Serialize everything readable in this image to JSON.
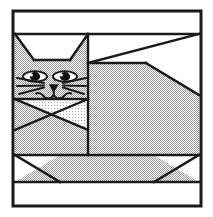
{
  "figure": {
    "title": "Cat quilt block",
    "caption": "Patchwork cat pieced block diagram",
    "width": 213,
    "height": 217
  },
  "colors": {
    "background": "#ffffff",
    "line": "#1a1a1a",
    "fabric_print": "#c9c9c9",
    "fabric_light": "#e4e4e4",
    "fabric_white": "#ffffff",
    "eye_black": "#111111",
    "eye_highlight": "#ffffff"
  },
  "frame": {
    "label": "Block outer border",
    "x": 13,
    "y": 11,
    "width": 188,
    "height": 195,
    "stroke_width": 3
  },
  "grid_lines": {
    "label": "Seam lines",
    "top_sash_y": 34,
    "lower_sash_y": 155,
    "bottom_sash_y": 182,
    "head_body_divider_x": 88,
    "head_ear_base_y": 60,
    "face_chin_y": 99,
    "head_bottom_y": 130
  },
  "parts": [
    {
      "name": "top-sashing-strip",
      "label": "Top sashing strip",
      "fill": "fabric_white"
    },
    {
      "name": "left-ear",
      "label": "Left ear",
      "fill": "fabric_print"
    },
    {
      "name": "right-ear",
      "label": "Right ear",
      "fill": "fabric_print"
    },
    {
      "name": "ear-gap",
      "label": "Background between ears",
      "fill": "fabric_white"
    },
    {
      "name": "face",
      "label": "Cat face",
      "fill": "fabric_print"
    },
    {
      "name": "muzzle",
      "label": "Muzzle patch",
      "fill": "fabric_light"
    },
    {
      "name": "left-eye",
      "label": "Left eye",
      "fill": "eye_black"
    },
    {
      "name": "right-eye",
      "label": "Right eye",
      "fill": "eye_black"
    },
    {
      "name": "nose",
      "label": "Nose triangle",
      "fill": "eye_black"
    },
    {
      "name": "whiskers",
      "label": "Whiskers",
      "fill": "line"
    },
    {
      "name": "mouth",
      "label": "Mouth",
      "fill": "line"
    },
    {
      "name": "chest",
      "label": "Chest wedge",
      "fill": "fabric_print"
    },
    {
      "name": "body",
      "label": "Body",
      "fill": "fabric_print"
    },
    {
      "name": "back-slope",
      "label": "Back slope background",
      "fill": "fabric_white"
    },
    {
      "name": "tail-wedge",
      "label": "Tail wedge background",
      "fill": "fabric_white"
    },
    {
      "name": "lower-body-band",
      "label": "Lower body band",
      "fill": "fabric_print"
    },
    {
      "name": "left-foot-corner",
      "label": "Left bottom corner background",
      "fill": "fabric_white"
    },
    {
      "name": "right-foot-corner",
      "label": "Right bottom corner background",
      "fill": "fabric_white"
    },
    {
      "name": "bottom-sashing-strip",
      "label": "Bottom sashing strip",
      "fill": "fabric_white"
    }
  ]
}
